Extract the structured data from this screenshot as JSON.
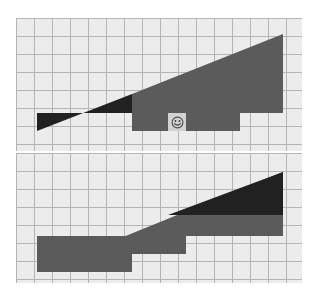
{
  "canvas": {
    "width": 316,
    "height": 299,
    "background": "#ffffff"
  },
  "palette": {
    "grid_cell": "#ececec",
    "grid_line": "#b4b4b4",
    "region_dark": "#212121",
    "region_gray": "#5b5b5b",
    "cursor_cell": "#d2d2d2",
    "cursor_stroke": "#4a4a4a"
  },
  "grid": {
    "cell_size": 18,
    "columns": 16,
    "rows_top": 7,
    "rows_bottom": 7,
    "line_width": 1
  },
  "panels": [
    {
      "name": "top-panel",
      "x": 16,
      "y": 18,
      "width": 286,
      "height": 133,
      "regions": [
        {
          "name": "dark-wedge",
          "fill": "#212121",
          "points": "21,113 116,76 116,95 21,95"
        },
        {
          "name": "gray-wedge",
          "fill": "#5b5b5b",
          "points": "116,76 267,16 267,95 116,95"
        },
        {
          "name": "gray-lower-block",
          "fill": "#5b5b5b",
          "points": "116,95 224,95 224,113 116,113"
        }
      ],
      "cursor": {
        "name": "smiley-cursor",
        "x": 152,
        "y": 95,
        "size": 18,
        "glyph": "smiley-face"
      }
    },
    {
      "name": "bottom-panel",
      "x": 16,
      "y": 153,
      "width": 286,
      "height": 130,
      "regions": [
        {
          "name": "gray-wedge",
          "fill": "#5b5b5b",
          "points": "21,119 267,19 267,83 21,83"
        },
        {
          "name": "dark-upper-block",
          "fill": "#212121",
          "points": "152,62 267,19 267,62 152,62"
        },
        {
          "name": "gray-step-mid",
          "fill": "#5b5b5b",
          "points": "21,83 170,83 170,101 21,101"
        },
        {
          "name": "gray-step-low",
          "fill": "#5b5b5b",
          "points": "21,101 116,101 116,119 21,119"
        }
      ],
      "cursor": null
    }
  ],
  "chart_data": {
    "type": "area",
    "title": "",
    "xlabel": "",
    "ylabel": "",
    "grid": true,
    "legend": "none",
    "series": [
      {
        "name": "top-panel-triangle",
        "color": "#5b5b5b",
        "x": [
          0,
          16
        ],
        "y": [
          0,
          97
        ],
        "baseline_steps": [
          18,
          18,
          18,
          18,
          18,
          18,
          0,
          0,
          0,
          0,
          0,
          0
        ],
        "dark_fraction": 0.39
      },
      {
        "name": "bottom-panel-triangle",
        "color": "#5b5b5b",
        "x": [
          0,
          16
        ],
        "y": [
          0,
          100
        ],
        "baseline_steps": [
          0,
          0,
          0,
          0,
          0,
          18,
          18,
          36,
          36,
          36,
          36
        ],
        "dark_fraction": 0.47
      }
    ],
    "xlim": [
      0,
      16
    ],
    "ylim": [
      0,
      7
    ]
  }
}
